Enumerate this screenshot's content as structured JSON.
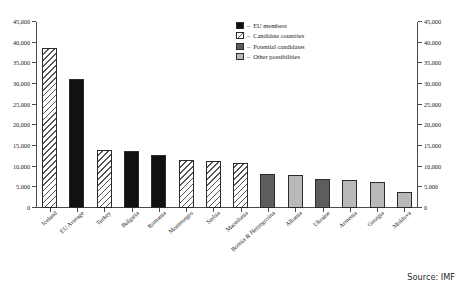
{
  "chart_data": {
    "type": "bar",
    "title": "",
    "subtitle": "",
    "xlabel": "",
    "ylabel": "",
    "ylim": [
      0,
      45000
    ],
    "ytick_step": 5000,
    "ytick_labels": [
      "0",
      "5,000",
      "10,000",
      "15,000",
      "20,000",
      "25,000",
      "30,000",
      "35,000",
      "40,000",
      "45,000"
    ],
    "ytick_values": [
      0,
      5000,
      10000,
      15000,
      20000,
      25000,
      30000,
      35000,
      40000,
      45000
    ],
    "dual_axis": true,
    "grid": false,
    "legend_position": "top-right",
    "categories": [
      "Iceland",
      "EU Average",
      "Turkey",
      "Bulgaria",
      "Romania",
      "Montenegro",
      "Serbia",
      "Macedonia",
      "Bosnia & Herzegovina",
      "Albania",
      "Ukraine",
      "Armenia",
      "Georgia",
      "Moldova"
    ],
    "values": [
      38600,
      31300,
      13950,
      13800,
      12800,
      11700,
      11300,
      11000,
      8300,
      8100,
      7100,
      6700,
      6400,
      3800
    ],
    "groups": [
      "candidate",
      "eu",
      "candidate",
      "eu",
      "eu",
      "candidate",
      "candidate",
      "candidate",
      "potential",
      "other",
      "potential",
      "other",
      "other",
      "other"
    ],
    "series": [
      {
        "name": "GDP per capita",
        "values": [
          38600,
          31300,
          13950,
          13800,
          12800,
          11700,
          11300,
          11000,
          8300,
          8100,
          7100,
          6700,
          6400,
          3800
        ]
      }
    ]
  },
  "legend": {
    "separator": "–",
    "items": [
      {
        "key": "eu",
        "label": "EU members",
        "color": "#111111",
        "pattern": "solid-black"
      },
      {
        "key": "candidate",
        "label": "Candidate countries",
        "color": "#ffffff",
        "pattern": "diagonal-hatch"
      },
      {
        "key": "potential",
        "label": "Potential candidates",
        "color": "#5d5d5d",
        "pattern": "solid-dark-gray"
      },
      {
        "key": "other",
        "label": "Other possibilities",
        "color": "#b9b9b9",
        "pattern": "solid-light-gray"
      }
    ]
  },
  "footer": {
    "source": "Source: IMF"
  },
  "colors": {
    "eu_members": "#111111",
    "candidate_countries": "#ffffff",
    "potential_candidates": "#5d5d5d",
    "other_possibilities": "#b9b9b9",
    "axis": "#4a4a4a",
    "text": "#1a1a1a",
    "background": "#ffffff"
  }
}
